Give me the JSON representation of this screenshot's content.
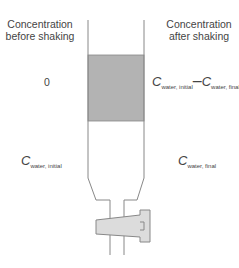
{
  "headers": {
    "before": "Concentration before shaking",
    "after": "Concentration after shaking"
  },
  "top_layer": {
    "before_value": "0",
    "after_value": {
      "term1_symbol": "C",
      "term1_sub": "water, initial",
      "operator": "–",
      "term2_symbol": "C",
      "term2_sub": "water, final"
    }
  },
  "bottom_layer": {
    "before_value": {
      "symbol": "C",
      "sub": "water, initial"
    },
    "after_value": {
      "symbol": "C",
      "sub": "water, final"
    }
  },
  "colors": {
    "organic_layer_fill": "#b3b3b3",
    "stopcock_fill": "#dcdcdc",
    "outline": "#888888"
  }
}
